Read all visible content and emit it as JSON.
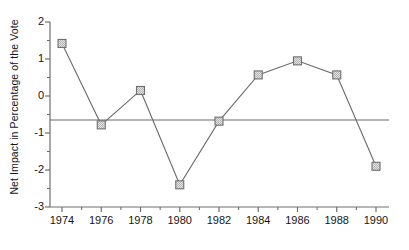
{
  "chart_data": {
    "type": "line",
    "title": "",
    "xlabel": "",
    "ylabel": "Net Impact in Percentage of the Vote",
    "categories": [
      1974,
      1976,
      1978,
      1980,
      1982,
      1984,
      1986,
      1988,
      1990
    ],
    "x": [
      1974,
      1976,
      1978,
      1980,
      1982,
      1984,
      1986,
      1988,
      1990
    ],
    "values": [
      1.42,
      -0.78,
      0.15,
      -2.4,
      -0.68,
      0.57,
      0.95,
      0.57,
      -1.9
    ],
    "series": [
      {
        "name": "Net Impact",
        "values": [
          1.42,
          -0.78,
          0.15,
          -2.4,
          -0.68,
          0.57,
          0.95,
          0.57,
          -1.9
        ]
      }
    ],
    "xlim": [
      1973.2,
      1990.6
    ],
    "ylim": [
      -3,
      2
    ],
    "ytick_labels": [
      "2",
      "1",
      "0",
      "-1",
      "-2",
      "-3"
    ],
    "ytick_values": [
      2,
      1,
      0,
      -1,
      -2,
      -3
    ],
    "yminor_values": [
      1.5,
      0.5,
      -0.5,
      -1.5,
      -2.5
    ],
    "xtick_labels": [
      "1974",
      "1976",
      "1978",
      "1980",
      "1982",
      "1984",
      "1986",
      "1988",
      "1990"
    ],
    "xtick_values": [
      1974,
      1976,
      1978,
      1980,
      1982,
      1984,
      1986,
      1988,
      1990
    ],
    "xminor_values": [
      1975,
      1977,
      1979,
      1981,
      1983,
      1985,
      1987,
      1989
    ],
    "grid": false,
    "legend": "none",
    "annotations": [
      {
        "type": "reference-line",
        "orientation": "horizontal",
        "value": -0.65,
        "label": ""
      }
    ],
    "colors": {
      "line": "#6b6b6b",
      "marker_fill": "#c9c9c9",
      "marker_edge": "#6f6f6f",
      "axis": "#6f6f6f",
      "text": "#141414",
      "background": "#ffffff",
      "reference_line": "#6b6b6b"
    },
    "marker_shape": "square"
  }
}
